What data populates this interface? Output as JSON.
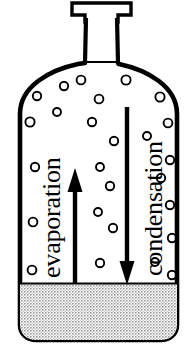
{
  "diagram": {
    "type": "science-illustration",
    "colors": {
      "outline": "#000000",
      "background": "#ffffff",
      "liquid_fill": "#d9d9d9",
      "liquid_dot": "#6e6e6e",
      "arrow": "#000000",
      "text": "#000000",
      "bubble_outline": "#000000"
    },
    "labels": {
      "evaporation": "evaporation",
      "condensation": "condensation"
    },
    "arrows": [
      {
        "name": "evaporation-arrow",
        "direction": "up",
        "x": 75,
        "from_y": 283,
        "to_y": 172
      },
      {
        "name": "condensation-arrow",
        "direction": "down",
        "x": 127,
        "from_y": 107,
        "to_y": 283
      }
    ],
    "container": {
      "name": "bottle",
      "cap_label": "cap",
      "neck_label": "neck",
      "body_label": "body",
      "liquid_label": "liquid",
      "liquid_surface_y": 283,
      "left_x": 20,
      "right_x": 177,
      "bottom_y": 340
    },
    "bubbles": [
      {
        "cx": 37,
        "cy": 96,
        "r": 4.2
      },
      {
        "cx": 64,
        "cy": 86,
        "r": 4.2
      },
      {
        "cx": 30,
        "cy": 122,
        "r": 4.6
      },
      {
        "cx": 57,
        "cy": 112,
        "r": 4.0
      },
      {
        "cx": 81,
        "cy": 80,
        "r": 4.4
      },
      {
        "cx": 99,
        "cy": 99,
        "r": 4.4
      },
      {
        "cx": 126,
        "cy": 80,
        "r": 4.6
      },
      {
        "cx": 160,
        "cy": 97,
        "r": 4.6
      },
      {
        "cx": 168,
        "cy": 123,
        "r": 4.4
      },
      {
        "cx": 92,
        "cy": 122,
        "r": 4.2
      },
      {
        "cx": 114,
        "cy": 141,
        "r": 4.2
      },
      {
        "cx": 147,
        "cy": 136,
        "r": 4.0
      },
      {
        "cx": 35,
        "cy": 167,
        "r": 4.2
      },
      {
        "cx": 100,
        "cy": 167,
        "r": 4.0
      },
      {
        "cx": 170,
        "cy": 160,
        "r": 4.2
      },
      {
        "cx": 161,
        "cy": 178,
        "r": 4.2
      },
      {
        "cx": 110,
        "cy": 186,
        "r": 4.2
      },
      {
        "cx": 98,
        "cy": 212,
        "r": 4.0
      },
      {
        "cx": 33,
        "cy": 222,
        "r": 4.4
      },
      {
        "cx": 113,
        "cy": 228,
        "r": 4.2
      },
      {
        "cx": 170,
        "cy": 205,
        "r": 4.2
      },
      {
        "cx": 172,
        "cy": 238,
        "r": 4.2
      },
      {
        "cx": 100,
        "cy": 263,
        "r": 4.2
      },
      {
        "cx": 32,
        "cy": 270,
        "r": 4.4
      },
      {
        "cx": 155,
        "cy": 262,
        "r": 4.0
      },
      {
        "cx": 172,
        "cy": 275,
        "r": 4.2
      }
    ]
  }
}
